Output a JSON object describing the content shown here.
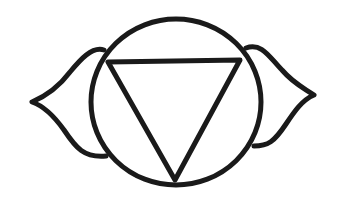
{
  "figure": {
    "title": "Ajna chakra symbol",
    "colors": {
      "background": "#ffffff",
      "ink": "#1a1a1a"
    },
    "stroke_width": 5,
    "elements": {
      "circle": {
        "cx": 176,
        "cy": 102,
        "rx": 85,
        "ry": 83
      },
      "triangle": {
        "points": [
          [
            108,
            62
          ],
          [
            240,
            60
          ],
          [
            175,
            180
          ]
        ]
      },
      "left_petal": {
        "tip": [
          30,
          103
        ]
      },
      "right_petal": {
        "tip": [
          315,
          95
        ]
      }
    }
  }
}
